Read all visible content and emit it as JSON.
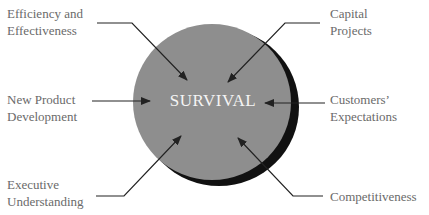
{
  "center": {
    "label": "SURVIVAL"
  },
  "factors": [
    {
      "id": "efficiency",
      "lines": [
        "Efficiency and",
        "Effectiveness"
      ]
    },
    {
      "id": "capital",
      "lines": [
        "Capital",
        "Projects"
      ]
    },
    {
      "id": "new-product",
      "lines": [
        "New Product",
        "Development"
      ]
    },
    {
      "id": "customers",
      "lines": [
        "Customers’",
        "Expectations"
      ]
    },
    {
      "id": "executive",
      "lines": [
        "Executive",
        "Understanding"
      ]
    },
    {
      "id": "competitiveness",
      "lines": [
        "Competitiveness"
      ]
    }
  ],
  "colors": {
    "circle": "#8e8e8e",
    "shadow": "#111111",
    "text": "#6a6a6a",
    "arrow": "#222222"
  }
}
